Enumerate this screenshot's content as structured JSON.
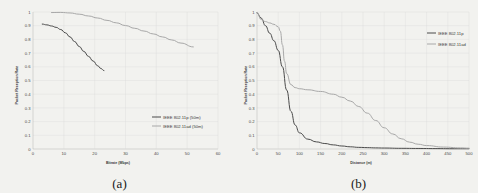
{
  "figure": {
    "background": "#f2f2ef",
    "panels": [
      {
        "caption": "(a)",
        "name": "panel-a"
      },
      {
        "caption": "(b)",
        "name": "panel-b"
      }
    ]
  },
  "chart_data": [
    {
      "type": "line",
      "panel": "(a)",
      "title": "",
      "xlabel": "Bitrate (Mbps)",
      "ylabel": "Packet Reception Rate",
      "xlim": [
        0,
        60
      ],
      "ylim": [
        0,
        1
      ],
      "xticks": [
        0,
        10,
        20,
        30,
        40,
        50,
        60
      ],
      "xtick_labels": [
        "0",
        "10",
        "20",
        "30",
        "40",
        "50",
        "60"
      ],
      "yticks": [
        0,
        0.1,
        0.2,
        0.3,
        0.4,
        0.5,
        0.6,
        0.7,
        0.8,
        0.9,
        1
      ],
      "ytick_labels": [
        "0",
        "0.1",
        "0.2",
        "0.3",
        "0.4",
        "0.5",
        "0.6",
        "0.7",
        "0.8",
        "0.9",
        "1"
      ],
      "grid": true,
      "legend_position": "lower-right",
      "series": [
        {
          "name": "IEEE 802.11p (50m)",
          "color": "#4a4a4a",
          "x": [
            3,
            4.5,
            6,
            7.5,
            9,
            10.5,
            12,
            13.5,
            15,
            16.5,
            18,
            19.5,
            21,
            22,
            23
          ],
          "y": [
            0.912,
            0.906,
            0.898,
            0.888,
            0.872,
            0.848,
            0.818,
            0.784,
            0.748,
            0.712,
            0.676,
            0.642,
            0.607,
            0.588,
            0.572
          ]
        },
        {
          "name": "IEEE 802.11ad (50m)",
          "color": "#a8a8a8",
          "x": [
            6,
            9,
            12,
            15,
            18,
            21,
            24,
            27,
            30,
            33,
            36,
            39,
            42,
            45,
            48,
            52
          ],
          "y": [
            0.996,
            0.997,
            0.993,
            0.984,
            0.971,
            0.956,
            0.939,
            0.921,
            0.901,
            0.881,
            0.861,
            0.84,
            0.818,
            0.796,
            0.773,
            0.745
          ]
        }
      ]
    },
    {
      "type": "line",
      "panel": "(b)",
      "title": "",
      "xlabel": "Distance (m)",
      "ylabel": "Packet Reception Rate",
      "xlim": [
        0,
        500
      ],
      "ylim": [
        0,
        1
      ],
      "xticks": [
        0,
        50,
        100,
        150,
        200,
        250,
        300,
        350,
        400,
        450,
        500
      ],
      "xtick_labels": [
        "0",
        "50",
        "100",
        "150",
        "200",
        "250",
        "300",
        "350",
        "400",
        "450",
        "500"
      ],
      "yticks": [
        0,
        0.1,
        0.2,
        0.3,
        0.4,
        0.5,
        0.6,
        0.7,
        0.8,
        0.9,
        1
      ],
      "ytick_labels": [
        "0",
        "0.1",
        "0.2",
        "0.3",
        "0.4",
        "0.5",
        "0.6",
        "0.7",
        "0.8",
        "0.9",
        "1"
      ],
      "grid": true,
      "legend_position": "upper-right",
      "series": [
        {
          "name": "IEEE 802.11p",
          "color": "#4a4a4a",
          "x": [
            0,
            10,
            20,
            30,
            40,
            50,
            60,
            70,
            80,
            90,
            100,
            120,
            140,
            160,
            180,
            200,
            220,
            240,
            260,
            280,
            300,
            340,
            380,
            420,
            460,
            500
          ],
          "y": [
            0.995,
            0.955,
            0.9,
            0.845,
            0.79,
            0.72,
            0.6,
            0.43,
            0.275,
            0.175,
            0.118,
            0.072,
            0.052,
            0.04,
            0.03,
            0.022,
            0.016,
            0.012,
            0.01,
            0.008,
            0.007,
            0.005,
            0.004,
            0.003,
            0.002,
            0.002
          ]
        },
        {
          "name": "IEEE 802.11ad",
          "color": "#a8a8a8",
          "x": [
            0,
            10,
            20,
            30,
            40,
            50,
            55,
            60,
            65,
            70,
            80,
            90,
            100,
            120,
            150,
            180,
            200,
            220,
            240,
            260,
            280,
            300,
            320,
            340,
            360,
            380,
            400,
            440,
            480,
            500
          ],
          "y": [
            0.995,
            0.945,
            0.93,
            0.92,
            0.91,
            0.892,
            0.86,
            0.76,
            0.64,
            0.55,
            0.47,
            0.448,
            0.44,
            0.432,
            0.42,
            0.4,
            0.378,
            0.35,
            0.31,
            0.262,
            0.208,
            0.155,
            0.11,
            0.075,
            0.05,
            0.035,
            0.025,
            0.014,
            0.008,
            0.006
          ]
        }
      ]
    }
  ]
}
